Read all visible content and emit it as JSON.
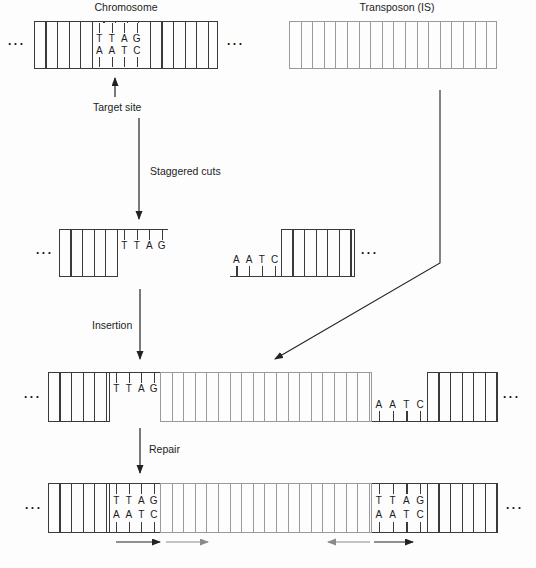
{
  "labels": {
    "chromosome": "Chromosome",
    "transposon": "Transposon (IS)",
    "target_site": "Target site",
    "staggered_cuts": "Staggered cuts",
    "insertion": "Insertion",
    "repair": "Repair",
    "ellipsis": "..."
  },
  "sequences": {
    "top": [
      "T",
      "T",
      "A",
      "G"
    ],
    "bottom": [
      "A",
      "A",
      "T",
      "C"
    ]
  },
  "colors": {
    "chromosome_line": "#3a3a3a",
    "transposon_line": "#9a9a9a",
    "arrow": "#222222",
    "repeat_arrow": "#8a8a8a",
    "text": "#1c1c1c",
    "background": "#fdfdfd"
  }
}
